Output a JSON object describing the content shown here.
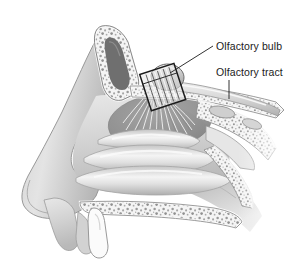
{
  "figure": {
    "background_color": "#ffffff",
    "width": 295,
    "height": 272
  },
  "labels": [
    {
      "id": "olfactory-bulb",
      "text": "Olfactory bulb",
      "x": 216,
      "y": 41,
      "leader": {
        "type": "diagonal",
        "from": [
          213,
          47
        ],
        "to": [
          170,
          73
        ]
      }
    },
    {
      "id": "olfactory-tract",
      "text": "Olfactory tract",
      "x": 216,
      "y": 67,
      "leader": {
        "type": "vertical",
        "from": [
          229,
          80
        ],
        "to": [
          229,
          98
        ]
      }
    }
  ],
  "structures": [
    {
      "name": "frontal-sinus",
      "kind": "air-cavity"
    },
    {
      "name": "cancellous-bone",
      "kind": "stippled-bone"
    },
    {
      "name": "cribriform-plate",
      "kind": "outlined-box"
    },
    {
      "name": "olfactory-bulb-body",
      "kind": "rounded-mass"
    },
    {
      "name": "olfactory-tract-body",
      "kind": "elongated-band"
    },
    {
      "name": "olfactory-nerve-fibers",
      "kind": "fiber-fan"
    },
    {
      "name": "olfactory-mucosa",
      "kind": "shaded-oval"
    },
    {
      "name": "superior-turbinate",
      "kind": "concha"
    },
    {
      "name": "middle-turbinate",
      "kind": "concha"
    },
    {
      "name": "inferior-turbinate",
      "kind": "concha"
    },
    {
      "name": "nasal-vestibule",
      "kind": "soft-tissue"
    },
    {
      "name": "external-nose",
      "kind": "soft-tissue"
    },
    {
      "name": "hard-palate",
      "kind": "stippled-bone"
    },
    {
      "name": "upper-lip",
      "kind": "soft-tissue"
    },
    {
      "name": "incisor-tooth",
      "kind": "tooth"
    },
    {
      "name": "sphenoid-sinus",
      "kind": "air-cavity"
    },
    {
      "name": "nasopharynx",
      "kind": "soft-tissue"
    }
  ],
  "colors": {
    "background": "#ffffff",
    "line_dark": "#1b1b1b",
    "tissue_light": "#d9d9d9",
    "tissue_mid": "#bdbdbd",
    "tissue_dark": "#9a9a9a",
    "mucosa_dark": "#8f8f8f",
    "bone_fill": "#f2f2f2",
    "stipple": "#9c9c9c",
    "cavity_dark": "#6e6e6e",
    "highlight": "#f6f6f6"
  }
}
